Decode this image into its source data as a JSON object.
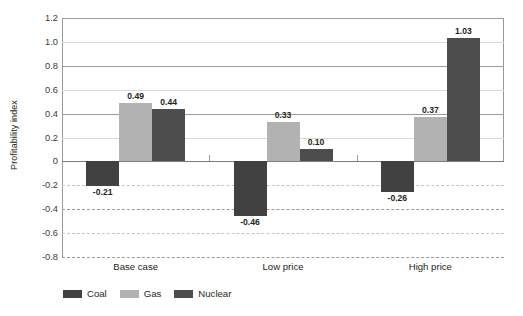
{
  "chart_data": {
    "type": "bar",
    "title": "",
    "subtitle": "",
    "xlabel": "",
    "ylabel": "Profitability index",
    "ylim": [
      -0.8,
      1.2
    ],
    "ytick_step": 0.2,
    "yticks": [
      "1.2",
      "1.0",
      "0.8",
      "0.6",
      "0.4",
      "0.2",
      "0",
      "-0.2",
      "-0.4",
      "-0.6",
      "-0.8"
    ],
    "ytick_values": [
      1.2,
      1.0,
      0.8,
      0.6,
      0.4,
      0.2,
      0,
      -0.2,
      -0.4,
      -0.6,
      -0.8
    ],
    "grid": true,
    "grid_note": "solid gridlines above zero, dashed gridlines below zero",
    "legend_position": "bottom-left",
    "categories": [
      "Base case",
      "Low price",
      "High price"
    ],
    "series": [
      {
        "name": "Coal",
        "color": "#414141",
        "values": [
          -0.21,
          -0.46,
          -0.26
        ],
        "labels": [
          "-0.21",
          "-0.46",
          "-0.26"
        ]
      },
      {
        "name": "Gas",
        "color": "#b2b2b2",
        "values": [
          0.49,
          0.33,
          0.37
        ],
        "labels": [
          "0.49",
          "0.33",
          "0.37"
        ]
      },
      {
        "name": "Nuclear",
        "color": "#4d4d4d",
        "values": [
          0.44,
          0.1,
          1.03
        ],
        "labels": [
          "0.44",
          "0.10",
          "1.03"
        ]
      }
    ]
  }
}
